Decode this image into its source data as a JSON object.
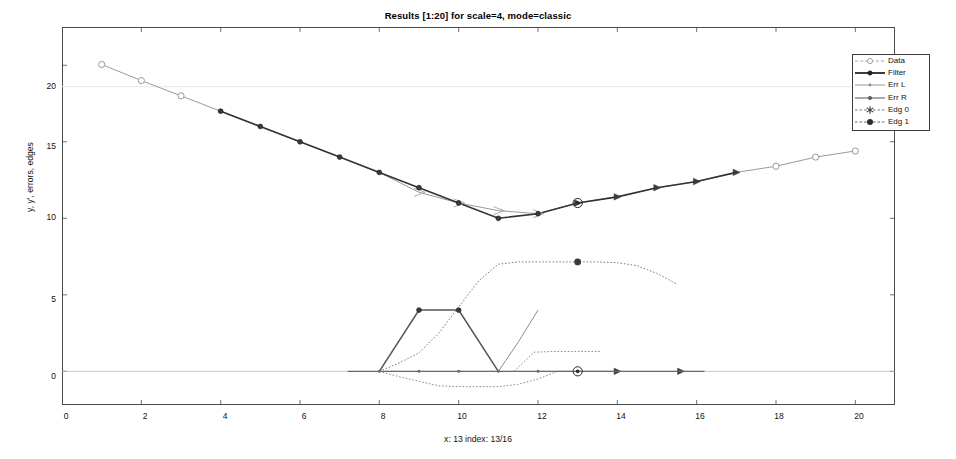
{
  "chart_data": {
    "type": "line",
    "title": "Results [1:20] for scale=4, mode=classic",
    "xlabel": "x: 13   index: 13/16",
    "ylabel": "y, y', errors, edges",
    "xlim": [
      0,
      21
    ],
    "ylim": [
      -2.2,
      22.5
    ],
    "xticks": [
      0,
      2,
      4,
      6,
      8,
      10,
      12,
      14,
      16,
      18,
      20
    ],
    "yticks": [
      0,
      5,
      10,
      15,
      20
    ],
    "grid": false,
    "legend_position": "top-right",
    "legend": [
      {
        "name": "Data",
        "marker": "open-circle",
        "color": "#9a9a9a"
      },
      {
        "name": "Filter",
        "marker": "filled-dot",
        "color": "#333333"
      },
      {
        "name": "Err L",
        "marker": "small-dot",
        "color": "#8d8d8d"
      },
      {
        "name": "Err R",
        "marker": "filled-dot",
        "color": "#6f6f6f"
      },
      {
        "name": "Edg 0",
        "marker": "star",
        "color": "#555555"
      },
      {
        "name": "Edg 1",
        "marker": "filled-hexagram",
        "color": "#3a3a3a"
      }
    ],
    "x": [
      1,
      2,
      3,
      4,
      5,
      6,
      7,
      8,
      9,
      10,
      11,
      12,
      13,
      14,
      15,
      16,
      17,
      18,
      19,
      20
    ],
    "series": [
      {
        "name": "Data",
        "color": "#9a9a9a",
        "marker": "open-circle",
        "values": [
          20.05,
          19.0,
          18.0,
          17.0,
          16.0,
          15.0,
          14.0,
          13.0,
          11.7,
          11.0,
          10.5,
          10.3,
          11.0,
          11.4,
          12.0,
          12.4,
          13.0,
          13.4,
          14.0,
          14.4
        ]
      },
      {
        "name": "Filter",
        "color": "#333333",
        "marker": "filled-dot",
        "values": [
          null,
          null,
          null,
          17.0,
          16.0,
          15.0,
          14.0,
          13.0,
          12.0,
          11.0,
          10.0,
          10.3,
          11.0,
          11.4,
          12.0,
          12.4,
          13.0,
          null,
          null,
          null
        ]
      },
      {
        "name": "Err L",
        "color": "#8d8d8d",
        "marker": "small-dot",
        "values": [
          0,
          0,
          0,
          0,
          0,
          0,
          0,
          0,
          -0.55,
          -0.9,
          -0.9,
          -0.45,
          0,
          0,
          0,
          0,
          0,
          0,
          0,
          0
        ]
      },
      {
        "name": "Err R",
        "color": "#6f6f6f",
        "marker": "filled-dot",
        "values": [
          0,
          0,
          0,
          0,
          0,
          0,
          0,
          0,
          0,
          0,
          0,
          0,
          0,
          0,
          0,
          0,
          0,
          0,
          0,
          0
        ]
      },
      {
        "name": "Edg 0",
        "color": "#555555",
        "marker": "star",
        "values": [
          0,
          0,
          0,
          0,
          0,
          0,
          0,
          0,
          0,
          4.0,
          4.0,
          0,
          0,
          0,
          0,
          0,
          0,
          0,
          0,
          0
        ]
      },
      {
        "name": "Edg 1",
        "color": "#3a3a3a",
        "marker": "filled-hexagram",
        "values": [
          0,
          0,
          0,
          0,
          0,
          0,
          0,
          0,
          0,
          0,
          0,
          0,
          7.15,
          0,
          0,
          0,
          0,
          0,
          0,
          0
        ]
      }
    ],
    "dotted_upper_trace": {
      "name": "edge-profile-upper",
      "color": "#7d7d7d",
      "points": [
        [
          8,
          0.0
        ],
        [
          8.5,
          0.55
        ],
        [
          9,
          1.2
        ],
        [
          9.5,
          2.5
        ],
        [
          10,
          4.2
        ],
        [
          10.5,
          5.9
        ],
        [
          11,
          7.0
        ],
        [
          11.5,
          7.15
        ],
        [
          12,
          7.15
        ],
        [
          12.5,
          7.15
        ],
        [
          13,
          7.15
        ],
        [
          13.5,
          7.15
        ],
        [
          14,
          7.1
        ],
        [
          14.5,
          6.9
        ],
        [
          15,
          6.4
        ],
        [
          15.5,
          5.7
        ]
      ]
    },
    "dotted_lower_trace": {
      "name": "error-profile-lower",
      "color": "#8d8d8d",
      "points": [
        [
          8,
          0.0
        ],
        [
          8.5,
          -0.35
        ],
        [
          9,
          -0.65
        ],
        [
          9.5,
          -0.95
        ],
        [
          10,
          -1.0
        ],
        [
          10.5,
          -1.0
        ],
        [
          11,
          -1.0
        ],
        [
          11.5,
          -0.85
        ],
        [
          12,
          -0.5
        ],
        [
          12.5,
          0.0
        ],
        [
          13,
          0.0
        ],
        [
          13.5,
          0.0
        ],
        [
          14,
          0.0
        ]
      ]
    },
    "err_r_rise": {
      "name": "err-r-rise",
      "color": "#8d8d8d",
      "points": [
        [
          11,
          0.0
        ],
        [
          11.5,
          1.9
        ],
        [
          12,
          4.0
        ]
      ]
    },
    "err_r_plateau": {
      "name": "err-r-plateau",
      "color": "#8d8d8d",
      "points": [
        [
          11.4,
          0.0
        ],
        [
          11.9,
          1.25
        ],
        [
          12.4,
          1.3
        ],
        [
          13.0,
          1.3
        ],
        [
          13.6,
          1.3
        ]
      ]
    },
    "edge_markers_baseline": {
      "name": "baseline-markers",
      "color": "#555555",
      "x": [
        8,
        9,
        10,
        11,
        12,
        13,
        14
      ],
      "y": 0
    },
    "highlight_markers": [
      {
        "name": "cursor-highlight-upper",
        "x": 13,
        "y": 11.0,
        "symbol": "circled-dot"
      },
      {
        "name": "cursor-highlight-baseline",
        "x": 13,
        "y": 0.0,
        "symbol": "circled-dot"
      }
    ]
  },
  "axes": {
    "ytick_labels": [
      "20",
      "15",
      "10",
      "5",
      "0"
    ],
    "xtick_labels": [
      "0",
      "2",
      "4",
      "6",
      "8",
      "10",
      "12",
      "14",
      "16",
      "18",
      "20"
    ]
  }
}
